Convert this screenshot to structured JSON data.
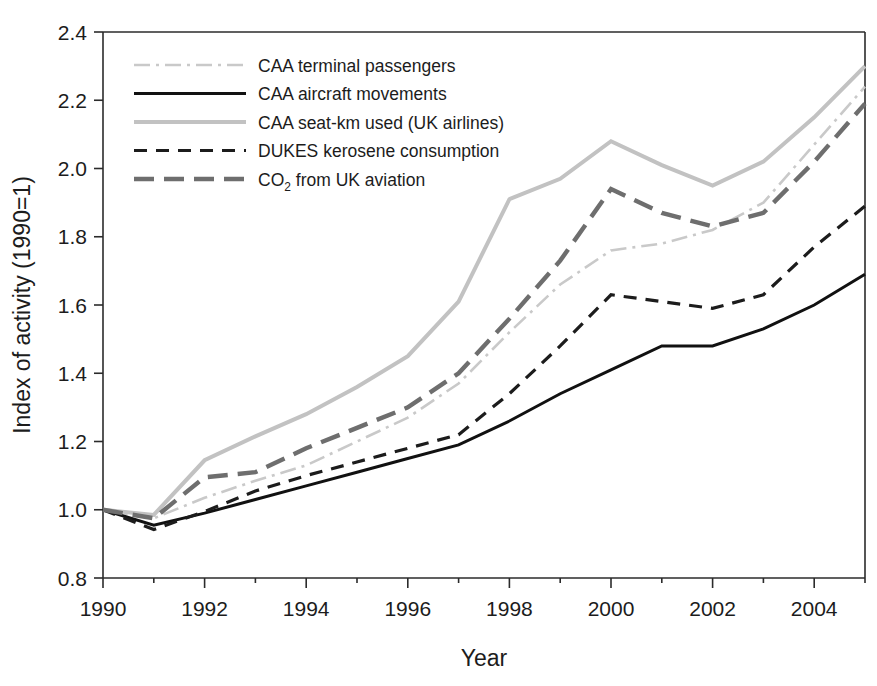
{
  "chart_data": {
    "type": "line",
    "title": "",
    "xlabel": "Year",
    "ylabel": "Index of activity (1990=1)",
    "xlim": [
      1990,
      2005
    ],
    "ylim": [
      0.8,
      2.4
    ],
    "xticks": [
      1990,
      1992,
      1994,
      1996,
      1998,
      2000,
      2002,
      2004
    ],
    "xtick_labels": [
      "1990",
      "1992",
      "1994",
      "1996",
      "1998",
      "2000",
      "2002",
      "2004"
    ],
    "yticks": [
      0.8,
      1.0,
      1.2,
      1.4,
      1.6,
      1.8,
      2.0,
      2.2,
      2.4
    ],
    "ytick_labels": [
      "0.8",
      "1.0",
      "1.2",
      "1.4",
      "1.6",
      "1.8",
      "2.0",
      "2.2",
      "2.4"
    ],
    "grid": false,
    "legend_position": "upper-left-inside",
    "x": [
      1990,
      1991,
      1992,
      1993,
      1994,
      1995,
      1996,
      1997,
      1998,
      1999,
      2000,
      2001,
      2002,
      2003,
      2004,
      2005
    ],
    "series": [
      {
        "name": "CAA terminal passengers",
        "style": "dash-dot",
        "color": "#c9c9c9",
        "width": 2.6,
        "dasharray": "16,6,3,6",
        "values": [
          1.0,
          0.975,
          1.035,
          1.085,
          1.13,
          1.2,
          1.27,
          1.37,
          1.52,
          1.66,
          1.76,
          1.78,
          1.82,
          1.9,
          2.07,
          2.24
        ]
      },
      {
        "name": "CAA aircraft movements",
        "style": "solid",
        "color": "#111111",
        "width": 3.0,
        "dasharray": "none",
        "values": [
          1.0,
          0.955,
          0.99,
          1.03,
          1.07,
          1.11,
          1.15,
          1.19,
          1.26,
          1.34,
          1.41,
          1.48,
          1.48,
          1.53,
          1.6,
          1.69
        ]
      },
      {
        "name": "CAA seat-km used (UK airlines)",
        "style": "solid",
        "color": "#c2c2c2",
        "width": 4.0,
        "dasharray": "none",
        "values": [
          1.0,
          0.985,
          1.145,
          1.215,
          1.28,
          1.36,
          1.45,
          1.61,
          1.91,
          1.97,
          2.08,
          2.01,
          1.95,
          2.02,
          2.15,
          2.3
        ]
      },
      {
        "name": "DUKES kerosene consumption",
        "style": "dashed",
        "color": "#1c1c1c",
        "width": 3.2,
        "dasharray": "13,9",
        "values": [
          1.0,
          0.942,
          0.995,
          1.055,
          1.1,
          1.14,
          1.18,
          1.22,
          1.34,
          1.48,
          1.63,
          1.61,
          1.59,
          1.63,
          1.77,
          1.89
        ]
      },
      {
        "name": "CO2 from UK aviation",
        "style": "long-dash",
        "color": "#6e6e6e",
        "width": 4.4,
        "dasharray": "20,10",
        "values": [
          1.0,
          0.975,
          1.095,
          1.11,
          1.18,
          1.24,
          1.3,
          1.4,
          1.56,
          1.73,
          1.94,
          1.87,
          1.83,
          1.87,
          2.02,
          2.19
        ]
      }
    ],
    "legend": [
      {
        "label": "CAA terminal passengers",
        "sub": "",
        "suffix": ""
      },
      {
        "label": "CAA aircraft movements",
        "sub": "",
        "suffix": ""
      },
      {
        "label": "CAA seat-km used (UK airlines)",
        "sub": "",
        "suffix": ""
      },
      {
        "label": "DUKES kerosene consumption",
        "sub": "",
        "suffix": ""
      },
      {
        "label": "CO",
        "sub": "2",
        "suffix": " from UK aviation"
      }
    ]
  }
}
